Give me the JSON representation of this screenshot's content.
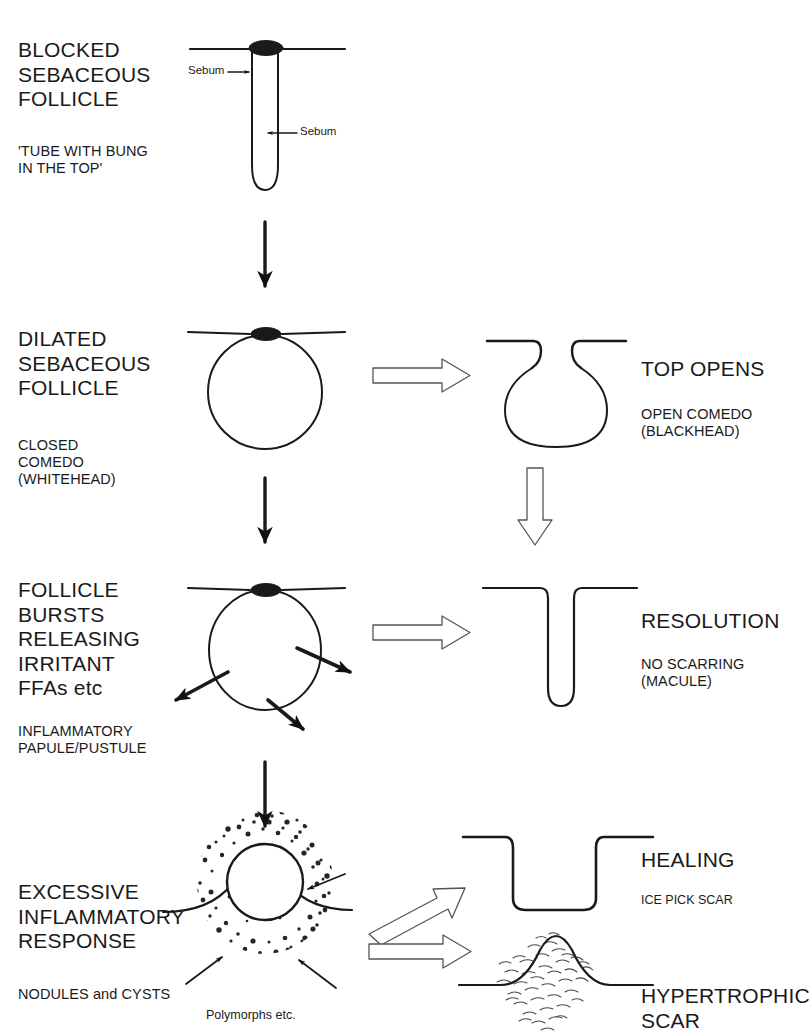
{
  "diagram": {
    "ink": "#1a1a1a",
    "background": "#ffffff"
  },
  "stages": [
    {
      "id": "blocked-follicle",
      "heading": "BLOCKED\nSEBACEOUS\nFOLLICLE",
      "caption": "'TUBE WITH BUNG\nIN THE TOP'",
      "annotations": [
        {
          "id": "sebum-plug",
          "label": "Sebum"
        },
        {
          "id": "sebum-lumen",
          "label": "Sebum"
        }
      ]
    },
    {
      "id": "dilated-follicle",
      "heading": "DILATED\nSEBACEOUS\nFOLLICLE",
      "caption": "CLOSED\nCOMEDO\n(WHITEHEAD)",
      "branch": {
        "heading": "TOP OPENS",
        "caption": "OPEN COMEDO\n(BLACKHEAD)"
      }
    },
    {
      "id": "follicle-bursts",
      "heading": "FOLLICLE\nBURSTS\nRELEASING\nIRRITANT\nFFAs etc",
      "caption": "INFLAMMATORY\nPAPULE/PUSTULE",
      "branch": {
        "heading": "RESOLUTION",
        "caption": "NO SCARRING\n(MACULE)"
      }
    },
    {
      "id": "excessive-inflammation",
      "heading": "EXCESSIVE\nINFLAMMATORY\nRESPONSE",
      "caption": "NODULES and CYSTS",
      "annotations": [
        {
          "id": "polymorphs",
          "label": "Polymorphs etc."
        }
      ],
      "outcomes": [
        {
          "id": "ice-pick",
          "heading": "HEALING",
          "caption": "ICE PICK SCAR"
        },
        {
          "id": "hypertrophic",
          "heading": "HYPERTROPHIC\nSCAR",
          "caption": ""
        }
      ]
    }
  ]
}
